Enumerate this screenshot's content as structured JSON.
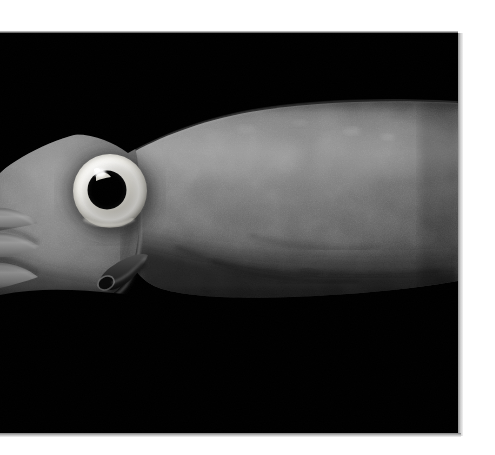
{
  "page": {
    "background_color": "#ffffff",
    "width": 495,
    "height": 455,
    "caption": ""
  },
  "photo": {
    "name": "squid-photograph",
    "background_color": "#000000",
    "left": 0,
    "top": 33,
    "width": 458,
    "height": 400,
    "subject": "squid",
    "orientation": "head-left",
    "lighting": "studio flash on black background",
    "shadow_color": "#a8a8a8"
  },
  "subject": {
    "label": "squid",
    "body_color_light": "#8c8c8c",
    "body_color_mid": "#6b6b6b",
    "body_color_dark": "#3a3a3a",
    "body_color_deep": "#1d1d1d",
    "parts": [
      {
        "name": "mantle",
        "label": "mantle",
        "description": "large tapering muscular body filling the right two thirds of the frame"
      },
      {
        "name": "mantle-collar",
        "label": "mantle collar",
        "description": "curved leading edge of the mantle behind the head"
      },
      {
        "name": "head",
        "label": "head",
        "description": "rounded head bearing the eye, left of the mantle collar"
      },
      {
        "name": "eye",
        "label": "eye",
        "description": "large round eye with pale ring and black pupil",
        "center_x": 110,
        "center_y": 158,
        "outer_radius": 38,
        "ring_color": "#f0efe9",
        "pupil_radius": 19,
        "pupil_color": "#050505",
        "highlight_color": "#ffffff"
      },
      {
        "name": "siphon",
        "label": "siphon (funnel)",
        "description": "short dark tube projecting down and left below the head",
        "color": "#2a2a2a"
      },
      {
        "name": "arms",
        "label": "arms and tentacles",
        "description": "pale arms extending off the left edge of the frame"
      }
    ]
  }
}
